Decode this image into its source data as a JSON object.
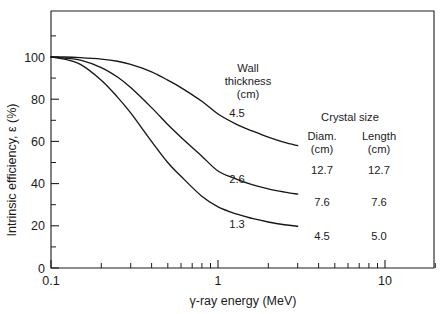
{
  "chart_data": {
    "type": "line",
    "title": "",
    "xlabel": "γ-ray energy (MeV)",
    "ylabel": "Intrinsic efficiency, ε (%)",
    "xscale": "log",
    "xlim": [
      0.1,
      20
    ],
    "ylim": [
      0,
      110
    ],
    "xticks": [
      0.1,
      1,
      10
    ],
    "xticklabels": [
      "0.1",
      "1",
      "10"
    ],
    "yticks": [
      0,
      20,
      40,
      60,
      80,
      100
    ],
    "yticklabels": [
      "0",
      "20",
      "40",
      "60",
      "80",
      "100"
    ],
    "grid": false,
    "legend_position": "inside-right",
    "series": [
      {
        "name": "4.5",
        "label": "4.5",
        "wall_thickness_cm": 4.5,
        "crystal_diameter_cm": 12.7,
        "crystal_length_cm": 12.7,
        "x": [
          0.1,
          0.12,
          0.15,
          0.2,
          0.25,
          0.3,
          0.4,
          0.5,
          0.6,
          0.8,
          1.0,
          1.3,
          1.6,
          2.0,
          2.5,
          3.0
        ],
        "y": [
          100,
          100,
          99.7,
          99,
          98,
          96.5,
          93,
          89,
          85.5,
          79,
          73,
          68,
          65,
          62,
          59.5,
          58
        ]
      },
      {
        "name": "2.6",
        "label": "2.6",
        "wall_thickness_cm": 2.6,
        "crystal_diameter_cm": 7.6,
        "crystal_length_cm": 7.6,
        "x": [
          0.1,
          0.12,
          0.15,
          0.2,
          0.25,
          0.3,
          0.4,
          0.5,
          0.6,
          0.8,
          1.0,
          1.3,
          1.6,
          2.0,
          2.5,
          3.0
        ],
        "y": [
          100,
          99.5,
          98.5,
          95,
          90.5,
          85.5,
          76,
          68,
          62,
          53,
          46,
          42,
          39.5,
          37.5,
          36,
          35
        ]
      },
      {
        "name": "1.3",
        "label": "1.3",
        "wall_thickness_cm": 1.3,
        "crystal_diameter_cm": 4.5,
        "crystal_length_cm": 5.0,
        "x": [
          0.1,
          0.12,
          0.15,
          0.2,
          0.25,
          0.3,
          0.4,
          0.5,
          0.6,
          0.8,
          1.0,
          1.3,
          1.6,
          2.0,
          2.5,
          3.0
        ],
        "y": [
          100,
          99,
          96.5,
          89,
          81,
          73.5,
          60,
          50,
          43.5,
          34,
          29,
          25.5,
          23.5,
          21.8,
          20.5,
          19.8
        ]
      }
    ],
    "annotations": {
      "wall_heading_line1": "Wall",
      "wall_heading_line2": "thickness",
      "wall_heading_line3": "(cm)",
      "curve_labels": [
        "4.5",
        "2.6",
        "1.3"
      ]
    },
    "legend_table": {
      "title": "Crystal size",
      "columns": [
        {
          "header_line1": "Diam.",
          "header_line2": "(cm)"
        },
        {
          "header_line1": "Length",
          "header_line2": "(cm)"
        }
      ],
      "rows": [
        {
          "diam": "12.7",
          "length": "12.7"
        },
        {
          "diam": "7.6",
          "length": "7.6"
        },
        {
          "diam": "4.5",
          "length": "5.0"
        }
      ]
    },
    "colors": {
      "curve": "#171717",
      "axis": "#1d1d1d",
      "background": "#ffffff"
    }
  }
}
